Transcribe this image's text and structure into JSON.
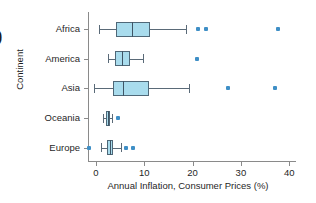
{
  "figure": {
    "corner_glyph": ")",
    "x_axis_title": "Annual Inflation, Consumer Prices (%)",
    "y_axis_title": "Continent"
  },
  "chart_data": {
    "type": "box",
    "title": "",
    "xlabel": "Annual Inflation, Consumer Prices (%)",
    "ylabel": "Continent",
    "xlim": [
      -3,
      43
    ],
    "xticks": [
      0,
      10,
      20,
      30,
      40
    ],
    "xtick_labels": [
      "0",
      "10",
      "20",
      "30",
      "40"
    ],
    "grid": false,
    "legend": "none",
    "orientation": "horizontal",
    "categories": [
      "Africa",
      "America",
      "Asia",
      "Oceania",
      "Europe"
    ],
    "boxes": [
      {
        "category": "Africa",
        "whisker_low": 0.6,
        "q1": 4.1,
        "median": 7.4,
        "q3": 11.2,
        "whisker_high": 18.6,
        "outliers": [
          21.2,
          22.7,
          37.6
        ]
      },
      {
        "category": "America",
        "whisker_low": 2.5,
        "q1": 3.9,
        "median": 5.3,
        "q3": 7.0,
        "whisker_high": 9.7,
        "outliers": [
          21.0
        ]
      },
      {
        "category": "Asia",
        "whisker_low": -0.4,
        "q1": 3.6,
        "median": 5.6,
        "q3": 11.0,
        "whisker_high": 19.3,
        "outliers": [
          27.4,
          37.1
        ]
      },
      {
        "category": "Oceania",
        "whisker_low": 1.5,
        "q1": 2.0,
        "median": 2.4,
        "q3": 2.9,
        "whisker_high": 3.3,
        "outliers": [
          4.5
        ]
      },
      {
        "category": "Europe",
        "whisker_low": 1.1,
        "q1": 2.2,
        "median": 2.8,
        "q3": 3.6,
        "whisker_high": 5.1,
        "outliers": [
          -1.5,
          6.1,
          7.6
        ]
      }
    ],
    "colors": {
      "box_fill": "#a9dced",
      "box_edge": "#4f6878",
      "median": "#3f5566",
      "whisker": "#5a6a78",
      "outlier": "#3f8fc6",
      "axis": "#8a8a8a"
    }
  }
}
